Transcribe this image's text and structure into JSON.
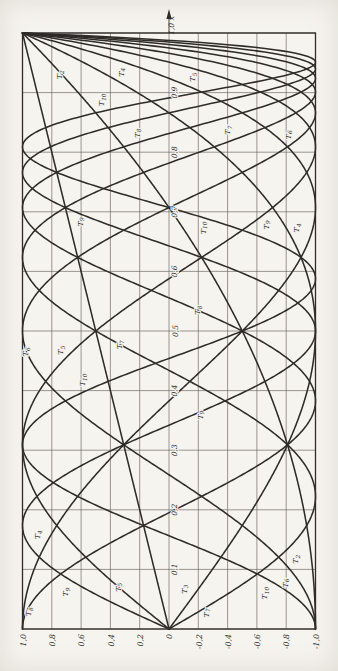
{
  "figure": {
    "background": "#f6f4ef",
    "ink": "#2e2c28",
    "grid_color": "#56534c",
    "description_label": "chebyshev-polynomials-rotated-plot"
  },
  "chart_data": {
    "type": "line",
    "title": "",
    "formula": "T_n(x) = cos(n·arccos x)",
    "xlabel": "x",
    "ylabel": "",
    "x_range": [
      0,
      1
    ],
    "y_range": [
      -1,
      1
    ],
    "x_tick_step": 0.1,
    "y_tick_step": 0.2,
    "grid": true,
    "rotated_90_ccw": true,
    "x_tick_values": [
      0.1,
      0.2,
      0.3,
      0.4,
      0.5,
      0.6,
      0.7,
      0.8,
      0.9
    ],
    "x_tick_labels": [
      "0,1",
      "0,2",
      "0,3",
      "0,4",
      "0,5",
      "0,6",
      "0,7",
      "0,8",
      "0,9"
    ],
    "x_max_label": "1,0",
    "axis_letter": "x",
    "y_tick_values": [
      1,
      0.8,
      0.6,
      0.4,
      0.2,
      0,
      -0.2,
      -0.4,
      -0.6,
      -0.8,
      -1
    ],
    "y_tick_labels": [
      "1,0",
      "0,8",
      "0,6",
      "0,4",
      "0,2",
      "0",
      "-0,2",
      "-0,4",
      "-0,6",
      "-0,8",
      "-1,0"
    ],
    "x_samples": [
      0,
      0.1,
      0.2,
      0.3,
      0.4,
      0.5,
      0.6,
      0.7,
      0.8,
      0.9,
      1
    ],
    "series": [
      {
        "name": "T_1",
        "n": 1,
        "values": [
          0,
          0.1,
          0.2,
          0.3,
          0.4,
          0.5,
          0.6,
          0.7,
          0.8,
          0.9,
          1
        ]
      },
      {
        "name": "T_2",
        "n": 2,
        "values": [
          -1,
          -0.98,
          -0.92,
          -0.82,
          -0.68,
          -0.5,
          -0.28,
          -0.02,
          0.28,
          0.62,
          1
        ]
      },
      {
        "name": "T_3",
        "n": 3,
        "values": [
          0,
          -0.296,
          -0.568,
          -0.792,
          -0.944,
          -1,
          -0.936,
          -0.728,
          -0.352,
          0.216,
          1
        ]
      },
      {
        "name": "T_4",
        "n": 4,
        "values": [
          1,
          0.921,
          0.693,
          0.345,
          -0.075,
          -0.5,
          -0.843,
          -0.999,
          -0.843,
          -0.231,
          1
        ]
      },
      {
        "name": "T_5",
        "n": 5,
        "values": [
          0,
          0.48,
          0.845,
          0.999,
          0.884,
          0.5,
          -0.076,
          -0.671,
          -0.997,
          -0.632,
          1
        ]
      },
      {
        "name": "T_6",
        "n": 6,
        "values": [
          -1,
          -0.825,
          -0.355,
          0.254,
          0.782,
          1,
          0.752,
          0.06,
          -0.753,
          -0.907,
          1
        ]
      },
      {
        "name": "T_7",
        "n": 7,
        "values": [
          0,
          -0.646,
          -0.987,
          -0.846,
          -0.259,
          0.5,
          0.978,
          0.755,
          -0.206,
          -1,
          1
        ]
      },
      {
        "name": "T_8",
        "n": 8,
        "values": [
          1,
          0.696,
          -0.04,
          -0.762,
          -0.989,
          -0.5,
          0.422,
          0.997,
          0.422,
          -0.893,
          1
        ]
      },
      {
        "name": "T_9",
        "n": 9,
        "values": [
          0,
          0.785,
          0.971,
          0.389,
          -0.532,
          -1,
          -0.472,
          0.641,
          0.881,
          -0.608,
          1
        ]
      },
      {
        "name": "T_10",
        "n": 10,
        "values": [
          -1,
          -0.538,
          0.429,
          0.996,
          0.562,
          -0.5,
          -0.988,
          -0.099,
          0.988,
          -0.201,
          1
        ]
      }
    ],
    "annotations": [
      {
        "label": "T_2",
        "x": 0.93,
        "y": 0.73
      },
      {
        "label": "T_4",
        "x": 0.934,
        "y": 0.31
      },
      {
        "label": "T_5",
        "x": 0.926,
        "y": -0.18
      },
      {
        "label": "T_10",
        "x": 0.888,
        "y": 0.44
      },
      {
        "label": "T_8",
        "x": 0.832,
        "y": 0.2
      },
      {
        "label": "T_7",
        "x": 0.837,
        "y": -0.42
      },
      {
        "label": "T_6",
        "x": 0.829,
        "y": -0.83
      },
      {
        "label": "T_9",
        "x": 0.683,
        "y": 0.59
      },
      {
        "label": "T_9",
        "x": 0.678,
        "y": -0.68
      },
      {
        "label": "T_10",
        "x": 0.673,
        "y": -0.25
      },
      {
        "label": "T_4",
        "x": 0.673,
        "y": -0.89
      },
      {
        "label": "T_8",
        "x": 0.535,
        "y": -0.21
      },
      {
        "label": "T_6",
        "x": 0.465,
        "y": 0.96
      },
      {
        "label": "T_5",
        "x": 0.468,
        "y": 0.72
      },
      {
        "label": "T_7",
        "x": 0.477,
        "y": 0.32
      },
      {
        "label": "T_10",
        "x": 0.418,
        "y": 0.57
      },
      {
        "label": "T_9",
        "x": 0.359,
        "y": -0.23
      },
      {
        "label": "T_4",
        "x": 0.158,
        "y": 0.88
      },
      {
        "label": "T_2",
        "x": 0.117,
        "y": -0.88
      },
      {
        "label": "T_8",
        "x": 0.029,
        "y": 0.94
      },
      {
        "label": "T_9",
        "x": 0.062,
        "y": 0.69
      },
      {
        "label": "T_5",
        "x": 0.07,
        "y": 0.33
      },
      {
        "label": "T_3",
        "x": 0.067,
        "y": -0.12
      },
      {
        "label": "T_7",
        "x": 0.027,
        "y": -0.27
      },
      {
        "label": "T_10",
        "x": 0.06,
        "y": -0.67
      },
      {
        "label": "T_6",
        "x": 0.077,
        "y": -0.81
      }
    ]
  }
}
